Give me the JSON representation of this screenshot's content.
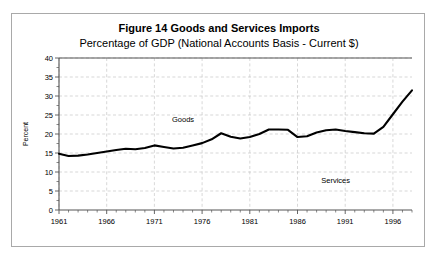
{
  "figure": {
    "title": "Figure 14 Goods and Services Imports",
    "subtitle": "Percentage of GDP (National Accounts Basis - Current $)"
  },
  "annotations": {
    "goods": "Goods",
    "services": "Services"
  },
  "axes": {
    "y_title": "Percent",
    "y_ticks": [
      "0",
      "5",
      "10",
      "15",
      "20",
      "25",
      "30",
      "35",
      "40"
    ],
    "x_ticks": [
      "1961",
      "1966",
      "1971",
      "1976",
      "1981",
      "1986",
      "1991",
      "1996"
    ]
  },
  "chart_data": {
    "type": "line",
    "title": "Figure 14 Goods and Services Imports",
    "subtitle": "Percentage of GDP (National Accounts Basis - Current $)",
    "xlabel": "",
    "ylabel": "Percent",
    "xlim": [
      1961,
      1998
    ],
    "ylim": [
      0,
      40
    ],
    "ytick_step": 5,
    "y_minor_step": 2.5,
    "xtick_step": 5,
    "grid": true,
    "legend": "none",
    "annotations": [
      {
        "text": "Goods",
        "x": 1974,
        "y": 23.2
      },
      {
        "text": "Services",
        "x": 1990,
        "y": 7.2
      }
    ],
    "series": [
      {
        "name": "Goods and Services Imports",
        "color": "#000000",
        "x": [
          1961,
          1962,
          1963,
          1964,
          1965,
          1966,
          1967,
          1968,
          1969,
          1970,
          1971,
          1972,
          1973,
          1974,
          1975,
          1976,
          1977,
          1978,
          1979,
          1980,
          1981,
          1982,
          1983,
          1984,
          1985,
          1986,
          1987,
          1988,
          1989,
          1990,
          1991,
          1992,
          1993,
          1994,
          1995,
          1996,
          1997,
          1998
        ],
        "values": [
          14.8,
          14.2,
          14.3,
          14.6,
          15.0,
          15.4,
          15.8,
          16.1,
          16.0,
          16.3,
          17.0,
          16.6,
          16.2,
          16.4,
          17.0,
          17.6,
          18.6,
          20.2,
          19.3,
          18.8,
          19.2,
          20.0,
          21.2,
          21.2,
          21.1,
          19.2,
          19.4,
          20.4,
          21.0,
          21.2,
          20.8,
          20.5,
          20.2,
          20.1,
          21.9,
          25.2,
          28.5,
          31.5
        ]
      }
    ]
  }
}
